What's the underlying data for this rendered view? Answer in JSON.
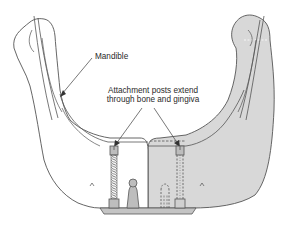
{
  "figure": {
    "type": "anatomical-illustration",
    "colors": {
      "line": "#555555",
      "bone_fill": "#ffffff",
      "overlay_fill": "#d8d8d8",
      "post_fill": "#bdbdbd",
      "bar_fill": "#c4c4c4"
    }
  },
  "labels": {
    "mandible": "Mandible",
    "posts_line1": "Attachment posts extend",
    "posts_line2": "through bone and gingiva"
  },
  "components": [
    {
      "name": "mandible-left-half",
      "shaded": false
    },
    {
      "name": "mandible-right-half",
      "shaded": true
    },
    {
      "name": "attachment-post-left",
      "style": "threaded"
    },
    {
      "name": "attachment-post-right",
      "style": "dashed-embedded"
    },
    {
      "name": "ball-abutment-center"
    },
    {
      "name": "ball-abutment-dashed-right"
    },
    {
      "name": "connector-bar-base"
    }
  ]
}
